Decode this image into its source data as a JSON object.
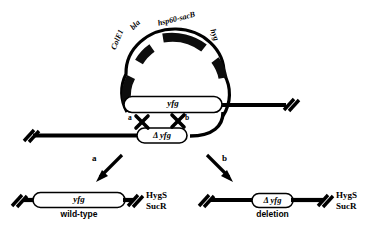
{
  "figure": {
    "colors": {
      "stroke": "#000000",
      "background": "#ffffff",
      "gene_block": "#0d0d0d"
    }
  },
  "plasmid": {
    "name": "suicide-plasmid",
    "genes": [
      {
        "id": "colE1",
        "label": "ColE1"
      },
      {
        "id": "bla",
        "label": "bla"
      },
      {
        "id": "hsp60-sacB",
        "label": "hsp60-sacB"
      },
      {
        "id": "hyg",
        "label": "hyg"
      }
    ],
    "insert": {
      "id": "delta-yfg",
      "label": "Δ yfg"
    }
  },
  "chromosome": {
    "name": "chromosome",
    "gene": {
      "id": "yfg",
      "label": "yfg"
    }
  },
  "crossovers": [
    {
      "id": "a",
      "label": "a"
    },
    {
      "id": "b",
      "label": "b"
    }
  ],
  "paths": [
    {
      "id": "a",
      "label": "a"
    },
    {
      "id": "b",
      "label": "b"
    }
  ],
  "outcomes": [
    {
      "id": "wild-type",
      "gene_label": "yfg",
      "name_label": "wild-type",
      "phenotype_line1": "HygS",
      "phenotype_line2": "SucR"
    },
    {
      "id": "deletion",
      "gene_label": "Δ yfg",
      "name_label": "deletion",
      "phenotype_line1": "HygS",
      "phenotype_line2": "SucR"
    }
  ]
}
